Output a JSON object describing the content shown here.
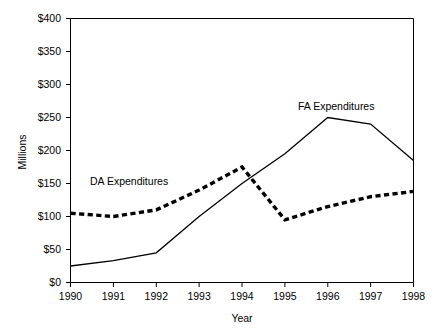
{
  "chart_data": {
    "type": "line",
    "title": "",
    "xlabel": "Year",
    "ylabel": "Millions",
    "categories": [
      "1990",
      "1991",
      "1992",
      "1993",
      "1994",
      "1995",
      "1996",
      "1997",
      "1998"
    ],
    "x": [
      1990,
      1991,
      1992,
      1993,
      1994,
      1995,
      1996,
      1997,
      1998
    ],
    "xlim": [
      1990,
      1998
    ],
    "ylim": [
      0,
      400
    ],
    "y_ticks": [
      0,
      50,
      100,
      150,
      200,
      250,
      300,
      350,
      400
    ],
    "y_tick_labels": [
      "$0",
      "$50",
      "$100",
      "$150",
      "$200",
      "$250",
      "$300",
      "$350",
      "$400"
    ],
    "grid": false,
    "legend_position": "inline-annotations",
    "series": [
      {
        "name": "DA Expenditures",
        "style": "dashed",
        "color": "#000000",
        "values": [
          105,
          100,
          110,
          140,
          175,
          95,
          115,
          130,
          138
        ]
      },
      {
        "name": "FA Expenditures",
        "style": "solid",
        "color": "#000000",
        "values": [
          25,
          33,
          45,
          100,
          150,
          195,
          250,
          240,
          185
        ]
      }
    ],
    "annotations": [
      {
        "text": "DA Expenditures",
        "series": "DA Expenditures",
        "x": 1991.4,
        "y": 152
      },
      {
        "text": "FA Expenditures",
        "series": "FA Expenditures",
        "x": 1995.9,
        "y": 268
      }
    ]
  },
  "axes": {
    "y_label": "Millions",
    "x_label": "Year",
    "y_tick_0": "$0",
    "y_tick_1": "$50",
    "y_tick_2": "$100",
    "y_tick_3": "$150",
    "y_tick_4": "$200",
    "y_tick_5": "$250",
    "y_tick_6": "$300",
    "y_tick_7": "$350",
    "y_tick_8": "$400",
    "x_tick_0": "1990",
    "x_tick_1": "1991",
    "x_tick_2": "1992",
    "x_tick_3": "1993",
    "x_tick_4": "1994",
    "x_tick_5": "1995",
    "x_tick_6": "1996",
    "x_tick_7": "1997",
    "x_tick_8": "1998"
  },
  "labels": {
    "da_series": "DA Expenditures",
    "fa_series": "FA Expenditures"
  },
  "colors": {
    "background": "#ffffff",
    "axis": "#000000",
    "series": "#000000"
  }
}
